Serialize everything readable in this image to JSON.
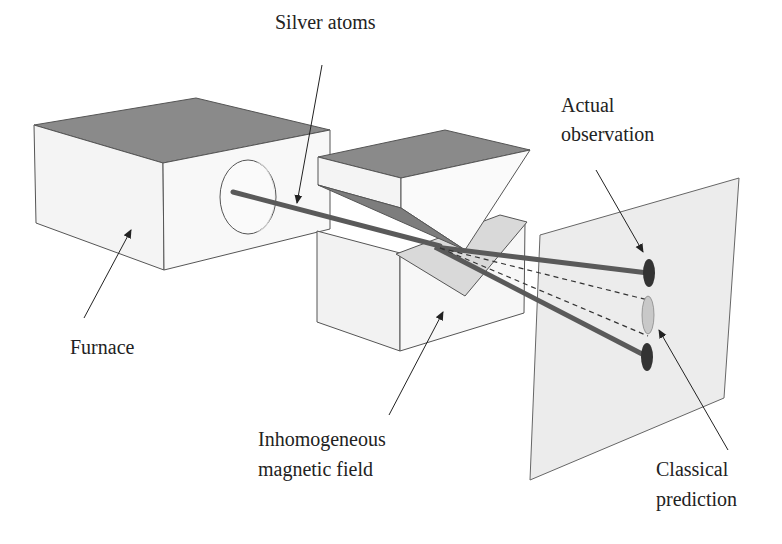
{
  "diagram": {
    "labels": {
      "silver_atoms": "Silver atoms",
      "actual_observation_line1": "Actual",
      "actual_observation_line2": "observation",
      "furnace": "Furnace",
      "magnet_line1": "Inhomogeneous",
      "magnet_line2": "magnetic field",
      "classical_line1": "Classical",
      "classical_line2": "prediction"
    },
    "colors": {
      "box_top": "#8a8a8a",
      "box_face": "#f4f4f4",
      "box_edge": "#555555",
      "beam": "#5a5a5a",
      "screen": "#ececec",
      "spot_actual": "#333333",
      "spot_classical": "#c8c8c8",
      "pole_dark": "#7d7d7d",
      "pole_light": "#d9d9d9"
    }
  }
}
